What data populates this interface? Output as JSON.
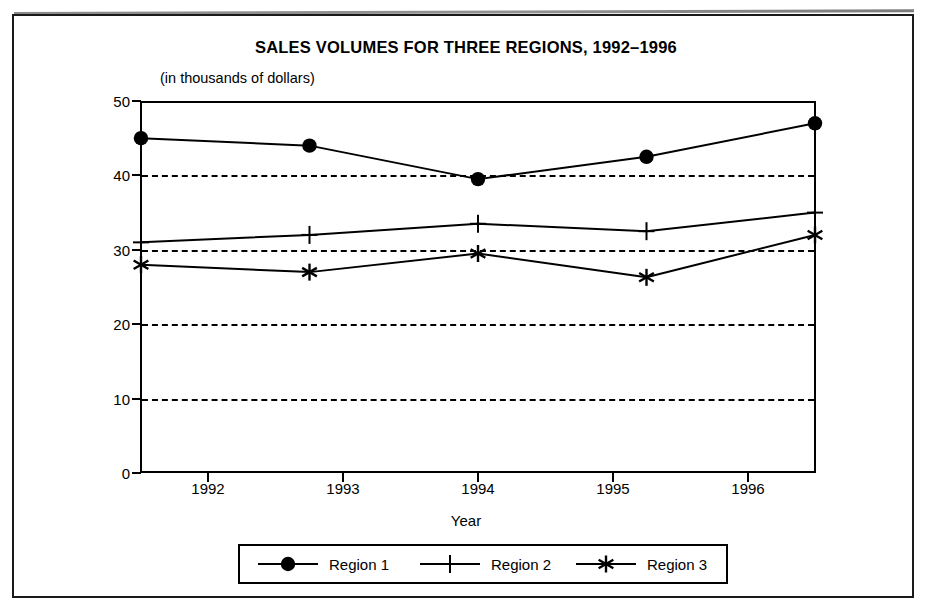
{
  "document": {
    "frame": "scanned-page-border"
  },
  "chart_data": {
    "type": "line",
    "title": "SALES VOLUMES FOR THREE REGIONS, 1992–1996",
    "subtitle": "(in thousands of dollars)",
    "xlabel": "Year",
    "ylabel": "",
    "categories": [
      "1992",
      "1993",
      "1994",
      "1995",
      "1996"
    ],
    "xtick_labels": [
      "1992",
      "1993",
      "1994",
      "1995",
      "1996"
    ],
    "ytick_labels": [
      "0",
      "10",
      "20",
      "30",
      "40",
      "50"
    ],
    "yticks": [
      0,
      10,
      20,
      30,
      40,
      50
    ],
    "ylim": [
      0,
      50
    ],
    "grid": "horizontal-dashed",
    "gridlines": [
      10,
      20,
      30,
      40
    ],
    "legend_position": "bottom-center",
    "series": [
      {
        "name": "Region 1",
        "marker": "filled-circle",
        "values": [
          45,
          44,
          39.5,
          42.5,
          47
        ]
      },
      {
        "name": "Region 2",
        "marker": "plus",
        "values": [
          31,
          32,
          33.5,
          32.5,
          35
        ]
      },
      {
        "name": "Region 3",
        "marker": "asterisk",
        "values": [
          28,
          27,
          29.5,
          26.3,
          32
        ]
      }
    ]
  },
  "colors": {
    "ink": "#000000",
    "paper": "#ffffff"
  },
  "legend": {
    "items": [
      {
        "label": "Region 1",
        "marker": "filled-circle"
      },
      {
        "label": "Region 2",
        "marker": "plus"
      },
      {
        "label": "Region 3",
        "marker": "asterisk"
      }
    ]
  }
}
